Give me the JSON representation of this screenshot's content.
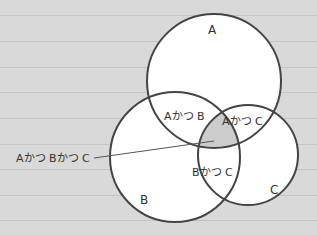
{
  "diagram": {
    "type": "venn",
    "sets": [
      {
        "id": "A",
        "label": "A"
      },
      {
        "id": "B",
        "label": "B"
      },
      {
        "id": "C",
        "label": "C"
      }
    ],
    "intersections": {
      "ab": "Aかつ B",
      "ac": "Aかつ C",
      "bc": "Bかつ C",
      "abc": "Aかつ Bかつ C"
    },
    "colors": {
      "background": "#d9d9d9",
      "circle_fill": "#ffffff",
      "circle_stroke": "#444444",
      "center_fill": "#cccccc",
      "rule_line": "#c4c4c4"
    }
  }
}
